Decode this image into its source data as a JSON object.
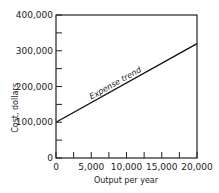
{
  "chart_data": {
    "type": "line",
    "title": "",
    "xlabel": "Output per year",
    "ylabel": "Cost, dollars",
    "xlim": [
      0,
      20000
    ],
    "ylim": [
      0,
      400000
    ],
    "x_ticks": [
      0,
      5000,
      10000,
      15000,
      20000
    ],
    "x_tick_labels": [
      "0",
      "5,000",
      "10,000",
      "15,000",
      "20,000"
    ],
    "y_ticks": [
      0,
      100000,
      200000,
      300000,
      400000
    ],
    "y_tick_labels": [
      "0",
      "100,000",
      "200,000",
      "300,000",
      "400,000"
    ],
    "grid": false,
    "series": [
      {
        "name": "Expense trend",
        "x": [
          0,
          20000
        ],
        "y": [
          100000,
          320000
        ]
      }
    ],
    "annotations": [
      {
        "text": "Expense trend"
      }
    ]
  }
}
